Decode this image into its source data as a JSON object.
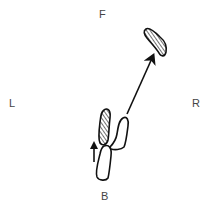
{
  "diagram": {
    "type": "footwork-step-diagram",
    "directions": {
      "front": "F",
      "back": "B",
      "left": "L",
      "right": "R"
    },
    "elements": [
      {
        "name": "left-foot-weighted",
        "style": "hatched",
        "position": "center-lower"
      },
      {
        "name": "left-foot-outline",
        "style": "outline",
        "position": "center-bottom"
      },
      {
        "name": "right-foot-start",
        "style": "outline",
        "position": "center-lower-right"
      },
      {
        "name": "right-foot-target",
        "style": "hatched",
        "position": "upper-right"
      },
      {
        "name": "movement-arrow",
        "from": "right-foot-start",
        "to": "right-foot-target"
      },
      {
        "name": "small-up-arrow",
        "position": "left of left foot"
      }
    ],
    "colors": {
      "ink": "#111111",
      "label": "#444444",
      "background": "#ffffff"
    }
  }
}
